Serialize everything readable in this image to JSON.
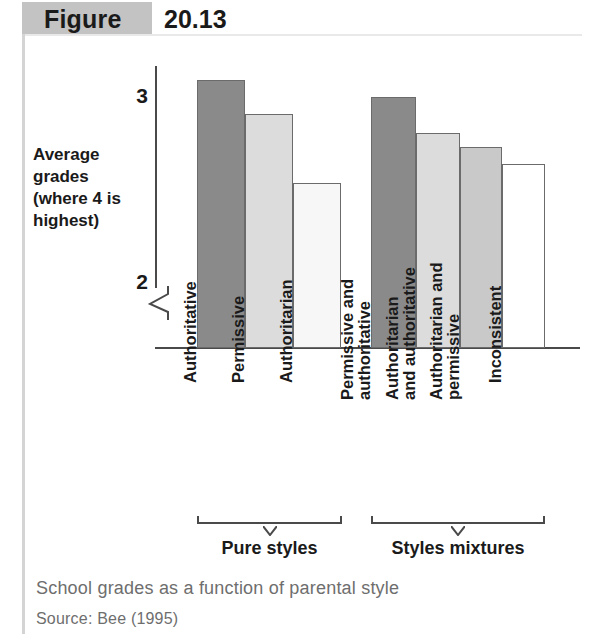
{
  "figure": {
    "tag_label": "Figure",
    "number": "20.13"
  },
  "caption": "School grades as a function of parental style",
  "source": "Source: Bee (1995)",
  "axis": {
    "y_title": "Average grades (where 4 is highest)",
    "y_ticks": [
      "3",
      "2"
    ]
  },
  "groups": [
    {
      "bracket_label": "Pure styles"
    },
    {
      "bracket_label": "Styles mixtures"
    }
  ],
  "colors": {
    "dark_gray": "#8a8a8a",
    "light_gray": "#dcdcdc",
    "medium_gray": "#c9c9c9",
    "near_white": "#f7f7f7",
    "white": "#ffffff",
    "tag_background": "#c3c3c3",
    "axis": "#4a4a4a",
    "caption": "#6e6e6e"
  },
  "chart_data": {
    "type": "bar",
    "title": "School grades as a function of parental style",
    "xlabel": "",
    "ylabel": "Average grades (where 4 is highest)",
    "ylim": [
      2.0,
      3.2
    ],
    "y_axis_break": true,
    "y_tick_values": [
      2,
      3
    ],
    "grid": false,
    "legend": "none",
    "categories": [
      "Authoritative",
      "Permissive",
      "Authoritarian",
      "Permissive and authoritative",
      "Authoritarian and authoritative",
      "Authoritarian and permissive",
      "Inconsistent"
    ],
    "values": [
      3.09,
      2.91,
      2.54,
      3.0,
      2.81,
      2.73,
      2.64
    ],
    "bars": [
      {
        "label_lines": [
          "Authoritative"
        ],
        "value": 3.09,
        "color": "#8a8a8a",
        "group": "Pure styles"
      },
      {
        "label_lines": [
          "Permissive"
        ],
        "value": 2.91,
        "color": "#dcdcdc",
        "group": "Pure styles"
      },
      {
        "label_lines": [
          "Authoritarian"
        ],
        "value": 2.54,
        "color": "#f7f7f7",
        "group": "Pure styles"
      },
      {
        "label_lines": [
          "Permissive and",
          "authoritative"
        ],
        "value": 3.0,
        "color": "#8a8a8a",
        "group": "Styles mixtures"
      },
      {
        "label_lines": [
          "Authoritarian",
          "and authoritative"
        ],
        "value": 2.81,
        "color": "#dcdcdc",
        "group": "Styles mixtures"
      },
      {
        "label_lines": [
          "Authoritarian and",
          "permissive"
        ],
        "value": 2.73,
        "color": "#c9c9c9",
        "group": "Styles mixtures"
      },
      {
        "label_lines": [
          "Inconsistent"
        ],
        "value": 2.64,
        "color": "#ffffff",
        "group": "Styles mixtures"
      }
    ],
    "group_brackets": [
      "Pure styles",
      "Styles mixtures"
    ]
  }
}
